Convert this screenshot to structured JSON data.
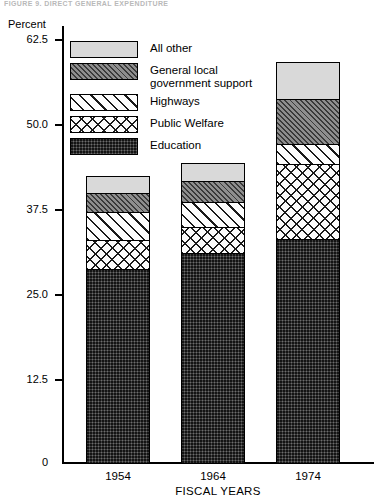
{
  "header": {
    "fragment_text": "FIGURE 9.  DIRECT GENERAL EXPENDITURE"
  },
  "axes": {
    "y_title": "Percent",
    "x_title": "FISCAL YEARS",
    "y_ticks": [
      "62.5",
      "50.0",
      "37.5",
      "25.0",
      "12.5",
      "0"
    ],
    "x_ticks": [
      "1954",
      "1964",
      "1974"
    ]
  },
  "legend": {
    "items": [
      {
        "label": "All other",
        "pattern": "dotted-light",
        "color": "#d9d9d9"
      },
      {
        "label": "General local\ngovernment support",
        "pattern": "diagonal-dense",
        "color": "#8e8e8e"
      },
      {
        "label": "Highways",
        "pattern": "diagonal-wide",
        "color": "#ffffff"
      },
      {
        "label": "Public Welfare",
        "pattern": "crosshatch",
        "color": "#ffffff"
      },
      {
        "label": "Education",
        "pattern": "solid-dark",
        "color": "#3d3d3d"
      }
    ]
  },
  "chart_data": {
    "type": "bar",
    "stacked": true,
    "title": "",
    "xlabel": "FISCAL YEARS",
    "ylabel": "Percent",
    "ylim": [
      0,
      62.5
    ],
    "yticks": [
      0,
      12.5,
      25.0,
      37.5,
      50.0,
      62.5
    ],
    "grid": false,
    "legend_position": "upper-left-inside",
    "categories": [
      "1954",
      "1964",
      "1974"
    ],
    "series": [
      {
        "name": "Education",
        "values": [
          28.5,
          30.9,
          33.0
        ]
      },
      {
        "name": "Public Welfare",
        "values": [
          4.3,
          3.8,
          11.0
        ]
      },
      {
        "name": "Highways",
        "values": [
          4.1,
          3.7,
          3.0
        ]
      },
      {
        "name": "General local government support",
        "values": [
          2.8,
          3.1,
          6.6
        ]
      },
      {
        "name": "All other",
        "values": [
          2.6,
          2.7,
          5.5
        ]
      }
    ],
    "totals": [
      42.3,
      44.2,
      59.1
    ]
  }
}
